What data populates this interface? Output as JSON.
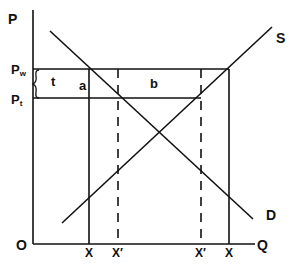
{
  "diagram": {
    "type": "supply-demand tariff diagram",
    "axes": {
      "y_label": "P",
      "x_label": "Q",
      "origin_label": "O"
    },
    "prices": [
      {
        "label": "P",
        "subscript": "w"
      },
      {
        "label": "P",
        "subscript": "t"
      }
    ],
    "curves": {
      "supply_label": "S",
      "demand_label": "D"
    },
    "regions": {
      "tariff_label": "t",
      "area_a": "a",
      "area_b": "b"
    },
    "quantity_ticks": [
      "X",
      "X′",
      "X′",
      "X"
    ],
    "colors": {
      "line": "#111111",
      "background": "#ffffff"
    }
  }
}
